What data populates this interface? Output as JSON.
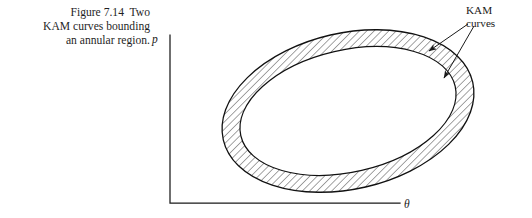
{
  "figure": {
    "caption_lines": [
      "Figure 7.14  Two",
      "KAM curves bounding",
      "an annular region."
    ],
    "axes": {
      "y_axis_label": "p",
      "x_axis_label": "θ"
    },
    "annotation": {
      "lines": [
        "KAM",
        "curves"
      ],
      "arrow_count": 2,
      "arrow_targets": [
        "outer-kam-curve",
        "inner-kam-curve"
      ]
    },
    "colors": {
      "ink": "#1a1a1a",
      "hatch": "#2b2b2b",
      "background": "#ffffff"
    },
    "diagram": {
      "shape": "elliptical-annulus",
      "outer_ellipse": {
        "cx": 348,
        "cy": 111,
        "rx": 128,
        "ry": 78,
        "rotation_deg": -13
      },
      "inner_ellipse": {
        "cx": 348,
        "cy": 111,
        "rx": 110,
        "ry": 61,
        "rotation_deg": -13
      },
      "fill": "diagonal-hatching",
      "hatch_angle_deg": 45
    }
  }
}
